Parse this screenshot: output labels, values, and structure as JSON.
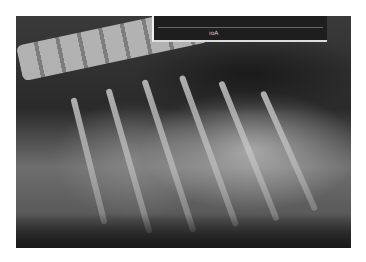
{
  "image": {
    "description": "Lateral thoracic radiograph (grayscale X-ray) showing spine, ribs and thoracic cavity",
    "frame": {
      "left": 16,
      "top": 16,
      "width": 335,
      "height": 232,
      "border_color": "#ffffff"
    },
    "label_box": {
      "text_left": "",
      "text_mid": "ıoΑ",
      "text_right_top": "",
      "text_right_bottom": ""
    },
    "colors": {
      "dark": "#1a1a1a",
      "mid": "#6e6e6e",
      "bone": "#c8c8c8"
    }
  }
}
